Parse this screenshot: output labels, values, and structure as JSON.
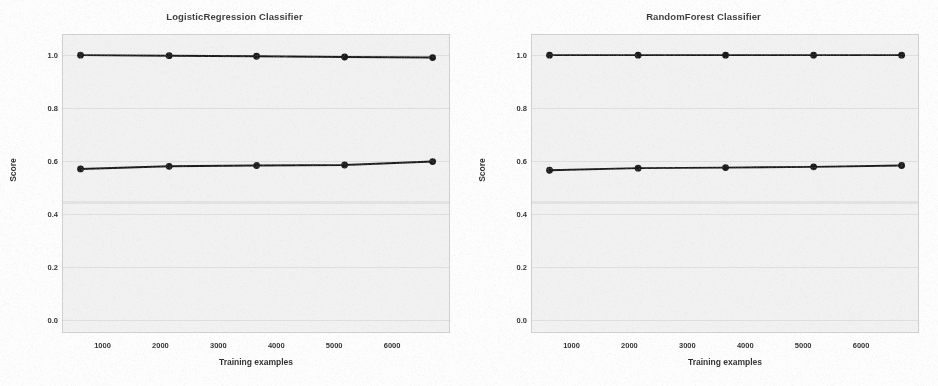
{
  "figure": {
    "background_color": "#fdfdfd",
    "plot_background_color": "#f1f1f1",
    "line_color": "#1a1a1a",
    "grid_color": "#d0d0d0"
  },
  "panels": [
    {
      "title": "LogisticRegression Classifier",
      "xlabel": "Training examples",
      "ylabel": "Score"
    },
    {
      "title": "RandomForest Classifier",
      "xlabel": "Training examples",
      "ylabel": "Score"
    }
  ],
  "axis": {
    "yticks": [
      "1.0",
      "0.8",
      "0.6",
      "0.4",
      "0.2",
      "0.0"
    ],
    "ytick_values": [
      1.0,
      0.8,
      0.6,
      0.4,
      0.2,
      0.0
    ],
    "xticks": [
      "1000",
      "2000",
      "3000",
      "4000",
      "5000",
      "6000"
    ],
    "xtick_values": [
      1000,
      2000,
      3000,
      4000,
      5000,
      6000
    ]
  },
  "chart_data": [
    {
      "type": "line",
      "title": "LogisticRegression Classifier",
      "xlabel": "Training examples",
      "ylabel": "Score",
      "xlim": [
        300,
        7000
      ],
      "ylim": [
        -0.05,
        1.08
      ],
      "grid": true,
      "legend": "none",
      "x": [
        620,
        2150,
        3660,
        5180,
        6700
      ],
      "series": [
        {
          "name": "Training score",
          "values": [
            1.0,
            0.998,
            0.996,
            0.993,
            0.991
          ]
        },
        {
          "name": "Cross-validation score",
          "values": [
            0.57,
            0.58,
            0.583,
            0.585,
            0.598
          ]
        }
      ],
      "annotations": [
        {
          "name": "faint-baseline-band",
          "y": 0.445
        }
      ]
    },
    {
      "type": "line",
      "title": "RandomForest Classifier",
      "xlabel": "Training examples",
      "ylabel": "Score",
      "xlim": [
        300,
        7000
      ],
      "ylim": [
        -0.05,
        1.08
      ],
      "grid": true,
      "legend": "none",
      "x": [
        620,
        2150,
        3660,
        5180,
        6700
      ],
      "series": [
        {
          "name": "Training score",
          "values": [
            1.0,
            1.0,
            1.0,
            1.0,
            1.0
          ]
        },
        {
          "name": "Cross-validation score",
          "values": [
            0.565,
            0.573,
            0.575,
            0.578,
            0.583
          ]
        }
      ],
      "annotations": [
        {
          "name": "faint-baseline-band",
          "y": 0.445
        }
      ]
    }
  ]
}
